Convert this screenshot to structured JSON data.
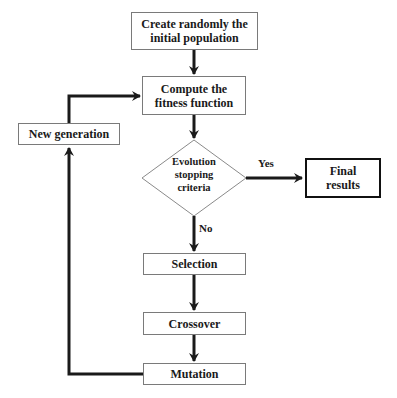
{
  "diagram": {
    "type": "flowchart",
    "nodes": {
      "init": {
        "label_line1": "Create randomly the",
        "label_line2": "initial population"
      },
      "fitness": {
        "label_line1": "Compute the",
        "label_line2": "fitness function"
      },
      "decision": {
        "label_line1": "Evolution",
        "label_line2": "stopping",
        "label_line3": "criteria"
      },
      "final": {
        "label_line1": "Final",
        "label_line2": "results"
      },
      "selection": {
        "label": "Selection"
      },
      "crossover": {
        "label": "Crossover"
      },
      "mutation": {
        "label": "Mutation"
      },
      "new_generation": {
        "label": "New generation"
      }
    },
    "edge_labels": {
      "yes": "Yes",
      "no": "No"
    },
    "colors": {
      "stroke": "#1a1a1a",
      "box_border": "#7a7a7a",
      "background": "#ffffff"
    }
  }
}
